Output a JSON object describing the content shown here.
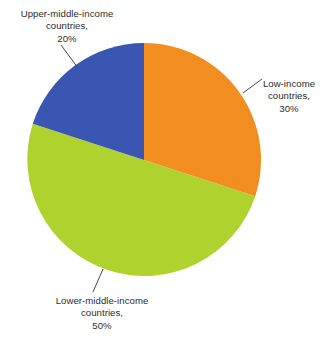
{
  "chart_data": {
    "type": "pie",
    "title": "",
    "subtitle": "",
    "xlabel": "",
    "ylabel": "",
    "categories": [
      "Low-income countries",
      "Lower-middle-income countries",
      "Upper-middle-income countries"
    ],
    "values": [
      30,
      50,
      20
    ],
    "units": "%",
    "start_angle_deg": 0,
    "direction": "clockwise",
    "legend": "none",
    "grid": false,
    "slices": [
      {
        "name": "low-income",
        "label_lines": [
          "Low-income",
          "countries,",
          "30%"
        ],
        "value": 30,
        "value_text": "30%",
        "color": "#F18E1F",
        "start_deg": 0,
        "end_deg": 108
      },
      {
        "name": "lower-middle-income",
        "label_lines": [
          "Lower-middle-income",
          "countries,",
          "50%"
        ],
        "value": 50,
        "value_text": "50%",
        "color": "#B0D22E",
        "start_deg": 108,
        "end_deg": 288
      },
      {
        "name": "upper-middle-income",
        "label_lines": [
          "Upper-middle-income",
          "countries,",
          "20%"
        ],
        "value": 20,
        "value_text": "20%",
        "color": "#3A56B2",
        "start_deg": 288,
        "end_deg": 360
      }
    ]
  },
  "colors": {
    "background": "#FFFFFF",
    "text": "#2B2B2B",
    "leader_line": "#4A4A4A",
    "low_income": "#F18E1F",
    "lower_middle_income": "#B0D22E",
    "upper_middle_income": "#3A56B2"
  },
  "labels": {
    "upper_middle": {
      "line1": "Upper-middle-income",
      "line2": "countries,",
      "line3": "20%"
    },
    "low": {
      "line1": "Low-income",
      "line2": "countries,",
      "line3": "30%"
    },
    "lower_middle": {
      "line1": "Lower-middle-income",
      "line2": "countries,",
      "line3": "50%"
    }
  }
}
